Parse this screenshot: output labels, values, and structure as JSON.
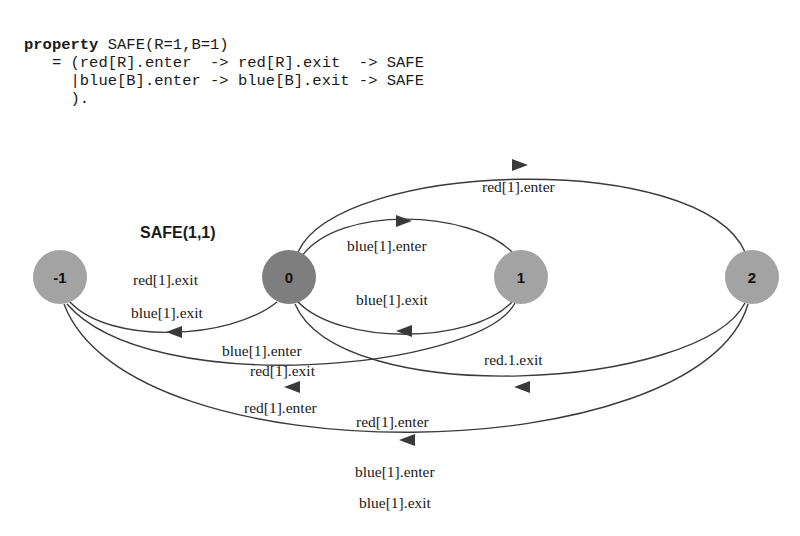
{
  "code": {
    "keyword": "property",
    "line1_rest": " SAFE(R=1,B=1)",
    "line2": "   = (red[R].enter  -> red[R].exit  -> SAFE",
    "line3": "     |blue[B].enter -> blue[B].exit -> SAFE",
    "line4": "     )."
  },
  "diagram": {
    "title": "SAFE(1,1)",
    "nodes": [
      {
        "id": "-1",
        "label": "-1",
        "color": "#a3a3a3"
      },
      {
        "id": "0",
        "label": "0",
        "color": "#7e7e7e"
      },
      {
        "id": "1",
        "label": "1",
        "color": "#a3a3a3"
      },
      {
        "id": "2",
        "label": "2",
        "color": "#a3a3a3"
      }
    ],
    "edges": [
      {
        "from": "0",
        "to": "2",
        "labels": [
          "red[1].enter"
        ]
      },
      {
        "from": "0",
        "to": "1",
        "labels": [
          "blue[1].enter"
        ]
      },
      {
        "from": "1",
        "to": "0",
        "labels": [
          "blue[1].exit"
        ]
      },
      {
        "from": "0",
        "to": "-1",
        "labels": [
          "red[1].exit",
          "blue[1].exit"
        ]
      },
      {
        "from": "1",
        "to": "-1",
        "labels": [
          "blue[1].enter",
          "red[1].exit",
          "red[1].enter"
        ]
      },
      {
        "from": "2",
        "to": "0",
        "labels": [
          "red.1.exit"
        ]
      },
      {
        "from": "2",
        "to": "-1",
        "labels": [
          "red[1].enter",
          "blue[1].enter",
          "blue[1].exit"
        ]
      }
    ],
    "edge_color": "#3a3a3a"
  }
}
